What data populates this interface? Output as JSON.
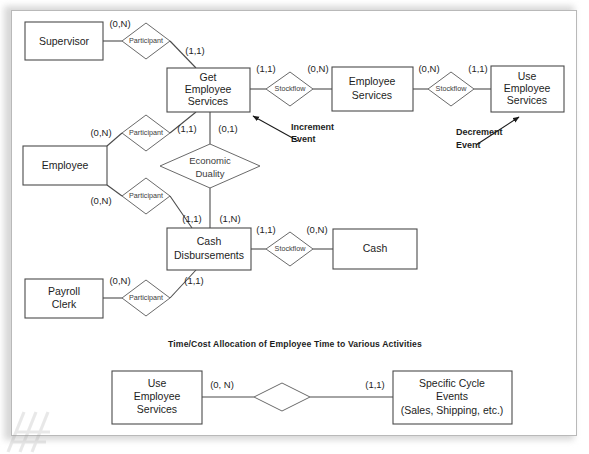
{
  "figure": {
    "section_title": "Time/Cost Allocation of Employee Time to Various Activities"
  },
  "entities": {
    "supervisor": {
      "label": "Supervisor"
    },
    "employee": {
      "label": "Employee"
    },
    "payroll_clerk": {
      "label": "Payroll\nClerk"
    },
    "get_emp_services": {
      "label": "Get\nEmployee\nServices"
    },
    "employee_services": {
      "label": "Employee\nServices"
    },
    "use_emp_services": {
      "label": "Use\nEmployee\nServices"
    },
    "cash_disbursements": {
      "label": "Cash\nDisbursements"
    },
    "cash": {
      "label": "Cash"
    },
    "use_emp_services_b": {
      "label": "Use\nEmployee\nServices"
    },
    "specific_cycle": {
      "label": "Specific Cycle\nEvents\n(Sales, Shipping, etc.)"
    }
  },
  "relationships": {
    "participant_sup": {
      "label": "Participant"
    },
    "participant_emp_top": {
      "label": "Participant"
    },
    "participant_emp_bot": {
      "label": "Participant"
    },
    "participant_clerk": {
      "label": "Participant"
    },
    "economic_duality": {
      "label": "Economic\nDuality"
    },
    "stockflow_1": {
      "label": "Stockflow"
    },
    "stockflow_2": {
      "label": "Stockflow"
    },
    "stockflow_3": {
      "label": "Stockflow"
    },
    "bottom_rel": {
      "label": ""
    }
  },
  "cardinalities": {
    "sup_to_part": "(0,N)",
    "part_to_get": "(1,1)",
    "get_to_sf1": "(1,1)",
    "sf1_to_empsvc": "(0,N)",
    "empsvc_to_sf2": "(0,N)",
    "sf2_to_usesvc": "(1,1)",
    "emp_to_part_top": "(0,N)",
    "part_top_to_get": "(1,1)",
    "get_to_duality": "(0,1)",
    "emp_to_part_bot": "(0,N)",
    "duality_to_cashdisb": "(1,N)",
    "part_bot_to_cashdisb": "(1,1)",
    "cashdisb_to_sf3": "(1,1)",
    "sf3_to_cash": "(0,N)",
    "clerk_to_part": "(0,N)",
    "part_clerk_to_cashdisb": "(1,1)",
    "bottom_left": "(0, N)",
    "bottom_right": "(1,1)"
  },
  "annotations": {
    "increment_event": "Increment\nEvent",
    "decrement_event": "Decrement\nEvent"
  },
  "colors": {
    "box_stroke": "#4b4b4b",
    "diamond_stroke": "#6a6a6a",
    "text": "#1d1d1d",
    "page_bg": "#ffffff",
    "page_border": "#b9b9b9"
  }
}
